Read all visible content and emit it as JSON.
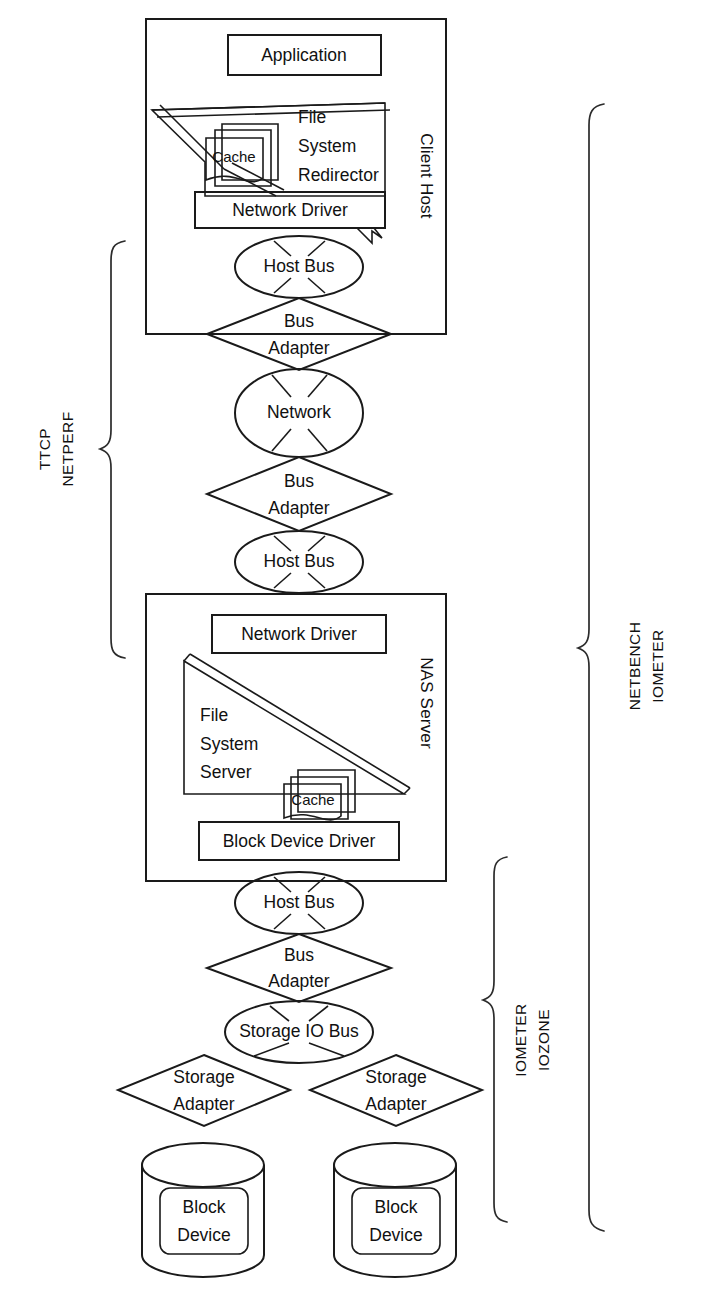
{
  "diagram": {
    "client_host": {
      "container_label": "Client Host",
      "application": "Application",
      "fs_redirector": {
        "line1": "File",
        "line2": "System",
        "line3": "Redirector"
      },
      "cache": "Cache",
      "network_driver": "Network Driver",
      "host_bus": "Host Bus"
    },
    "interconnect": {
      "bus_adapter_top": {
        "line1": "Bus",
        "line2": "Adapter"
      },
      "network": "Network",
      "bus_adapter_bottom": {
        "line1": "Bus",
        "line2": "Adapter"
      },
      "host_bus": "Host Bus"
    },
    "nas_server": {
      "container_label": "NAS Server",
      "network_driver": "Network Driver",
      "fs_server": {
        "line1": "File",
        "line2": "System",
        "line3": "Server"
      },
      "cache": "Cache",
      "block_device_driver": "Block Device Driver"
    },
    "storage": {
      "host_bus": "Host Bus",
      "bus_adapter": {
        "line1": "Bus",
        "line2": "Adapter"
      },
      "storage_io_bus": "Storage IO Bus",
      "storage_adapter_left": {
        "line1": "Storage",
        "line2": "Adapter"
      },
      "storage_adapter_right": {
        "line1": "Storage",
        "line2": "Adapter"
      },
      "block_device_left": {
        "line1": "Block",
        "line2": "Device"
      },
      "block_device_right": {
        "line1": "Block",
        "line2": "Device"
      }
    },
    "braces": {
      "left": {
        "line1": "TTCP",
        "line2": "NETPERF"
      },
      "right": {
        "line1": "NETBENCH",
        "line2": "IOMETER"
      },
      "inner_right": {
        "line1": "IOMETER",
        "line2": "IOZONE"
      }
    },
    "colors": {
      "stroke": "#1a1a1a",
      "background": "#ffffff"
    }
  }
}
